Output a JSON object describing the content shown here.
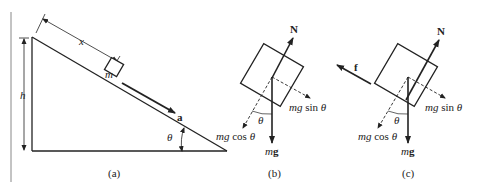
{
  "figure": {
    "panels": [
      {
        "id": "a",
        "caption": "(a)",
        "description": "Block of mass m on inclined plane of height h and angle theta, distance x along incline, acceleration a down the incline"
      },
      {
        "id": "b",
        "caption": "(b)",
        "description": "Free-body diagram without friction"
      },
      {
        "id": "c",
        "caption": "(c)",
        "description": "Free-body diagram with friction f"
      }
    ],
    "labels": {
      "mass": "m",
      "distance": "x",
      "height": "h",
      "acceleration": "a",
      "angle": "θ",
      "normal": "N",
      "friction": "f",
      "weight": "mg",
      "parallel_component": "mg sin θ",
      "perpendicular_component": "mg cos θ"
    },
    "colors": {
      "line": "#222222",
      "background": "#ffffff"
    }
  }
}
